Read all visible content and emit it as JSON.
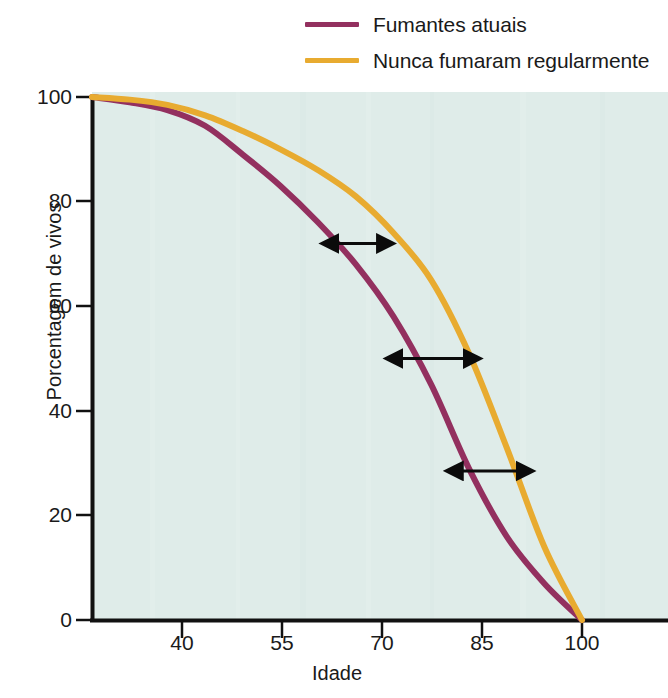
{
  "chart_data": {
    "type": "line",
    "title": "",
    "xlabel": "Idade",
    "ylabel": "Porcentagem de vivos",
    "xlim": [
      35,
      100
    ],
    "ylim": [
      0,
      100
    ],
    "xticks": [
      40,
      55,
      70,
      85,
      100
    ],
    "yticks": [
      0,
      20,
      40,
      60,
      80,
      100
    ],
    "grid": false,
    "legend_position": "top-right",
    "plot_background": "#dfece9",
    "x": [
      35,
      40,
      45,
      50,
      55,
      60,
      65,
      70,
      75,
      80,
      85,
      90,
      95,
      100
    ],
    "series": [
      {
        "name": "Fumantes atuais",
        "color": "#93305f",
        "values": [
          100,
          99,
          97.5,
          94.5,
          89,
          83,
          76,
          68,
          58,
          45,
          29,
          16,
          7,
          0
        ]
      },
      {
        "name": "Nunca fumaram regularmente",
        "color": "#e8ab30",
        "values": [
          100,
          99.5,
          98.5,
          96.5,
          93.5,
          90,
          86,
          81,
          74,
          65,
          51,
          33,
          14,
          0
        ]
      }
    ],
    "annotations": [
      {
        "name": "survival-gap-arrow-1",
        "kind": "double-arrow",
        "x_from": 67.5,
        "x_to": 73,
        "y": 72
      },
      {
        "name": "survival-gap-arrow-2",
        "kind": "double-arrow",
        "x_from": 76,
        "x_to": 84.5,
        "y": 50
      },
      {
        "name": "survival-gap-arrow-3",
        "kind": "double-arrow",
        "x_from": 84,
        "x_to": 91.5,
        "y": 28.5
      }
    ]
  },
  "legend": {
    "items": [
      {
        "label": "Fumantes atuais",
        "color": "#93305f"
      },
      {
        "label": "Nunca fumaram regularmente",
        "color": "#e8ab30"
      }
    ]
  },
  "axes": {
    "y_title": "Porcentagem de vivos",
    "x_title": "Idade",
    "y_tick_labels": [
      "100",
      "80",
      "60",
      "40",
      "20",
      "0"
    ],
    "x_tick_labels": [
      "40",
      "55",
      "70",
      "85",
      "100"
    ]
  }
}
